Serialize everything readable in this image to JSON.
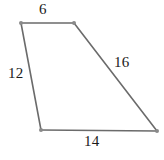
{
  "figure": {
    "type": "quadrilateral",
    "stroke_color": "#6b6b6b",
    "vertex_color": "#8a8a8a",
    "label_color": "#1a1a1a",
    "background_color": "#ffffff",
    "vertices": [
      {
        "name": "top-left",
        "x": 21,
        "y": 23
      },
      {
        "name": "top-right",
        "x": 74,
        "y": 23
      },
      {
        "name": "bottom-right",
        "x": 157,
        "y": 131
      },
      {
        "name": "bottom-left",
        "x": 41,
        "y": 130
      }
    ],
    "sides": [
      {
        "name": "top",
        "label": "6",
        "from": "top-left",
        "to": "top-right"
      },
      {
        "name": "right",
        "label": "16",
        "from": "top-right",
        "to": "bottom-right"
      },
      {
        "name": "bottom",
        "label": "14",
        "from": "bottom-left",
        "to": "bottom-right"
      },
      {
        "name": "left",
        "label": "12",
        "from": "top-left",
        "to": "bottom-left"
      }
    ],
    "path": "M 21 23 L 74 23 L 157 131 L 41 130 Z"
  }
}
